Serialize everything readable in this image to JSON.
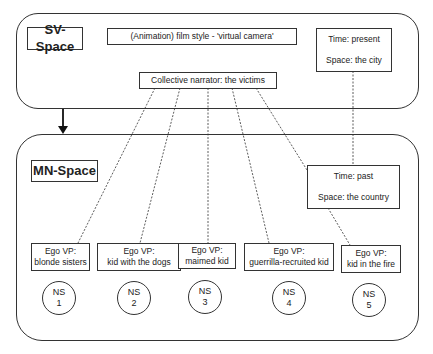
{
  "sv_space": {
    "label": "SV-Space",
    "film_style": "(Animation) film style - 'virtual camera'",
    "time": "Time: present",
    "space": "Space: the city",
    "narrator": "Collective narrator: the victims"
  },
  "mn_space": {
    "label": "MN-Space",
    "time": "Time: past",
    "space": "Space: the country",
    "ego_vps": [
      {
        "title": "Ego VP:",
        "name": "blonde sisters"
      },
      {
        "title": "Ego VP:",
        "name": "kid with the dogs"
      },
      {
        "title": "Ego VP:",
        "name": "maimed kid"
      },
      {
        "title": "Ego VP:",
        "name": "guerrilla-recruited kid"
      },
      {
        "title": "Ego VP:",
        "name": "kid in the fire"
      }
    ],
    "narrative_sequences": [
      {
        "label": "NS",
        "num": "1"
      },
      {
        "label": "NS",
        "num": "2"
      },
      {
        "label": "NS",
        "num": "3"
      },
      {
        "label": "NS",
        "num": "4"
      },
      {
        "label": "NS",
        "num": "5"
      }
    ]
  }
}
